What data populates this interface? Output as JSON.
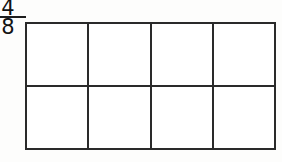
{
  "worksheet": {
    "name": "fraction-area-model",
    "description": "Fraction written as numerator over denominator beside an unshaded rectangular area model divided into equal parts",
    "background_color": "#fdfdfc"
  },
  "fraction": {
    "numerator": "4",
    "denominator": "8",
    "bar_color": "#1d1d1d",
    "text_color": "#121212"
  },
  "grid": {
    "columns": 4,
    "rows": 2,
    "total_cells": 8,
    "shaded_cells": 0,
    "line_color": "#2a2a2a",
    "cell_fill_color": "#ffffff",
    "shaded_fill_color": "#8e8e8e",
    "cells": [
      [
        {
          "id": "r1c1",
          "shaded": false,
          "label": ""
        },
        {
          "id": "r1c2",
          "shaded": false,
          "label": ""
        },
        {
          "id": "r1c3",
          "shaded": false,
          "label": ""
        },
        {
          "id": "r1c4",
          "shaded": false,
          "label": ""
        }
      ],
      [
        {
          "id": "r2c1",
          "shaded": false,
          "label": ""
        },
        {
          "id": "r2c2",
          "shaded": false,
          "label": ""
        },
        {
          "id": "r2c3",
          "shaded": false,
          "label": ""
        },
        {
          "id": "r2c4",
          "shaded": false,
          "label": ""
        }
      ]
    ]
  }
}
